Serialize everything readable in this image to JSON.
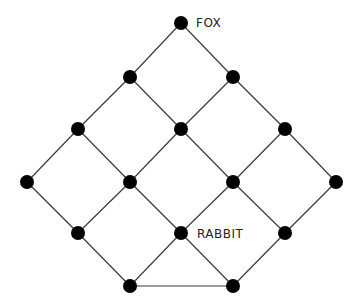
{
  "diagram": {
    "type": "lattice-graph",
    "colors": {
      "node": "#000000",
      "edge": "#3a3a3a",
      "label": "#222222",
      "background": "#ffffff"
    },
    "node_radius": 7,
    "nodes": [
      {
        "id": "n0",
        "x": 181,
        "y": 23,
        "label": "FOX"
      },
      {
        "id": "n1",
        "x": 130,
        "y": 77,
        "label": ""
      },
      {
        "id": "n2",
        "x": 233,
        "y": 77,
        "label": ""
      },
      {
        "id": "n3",
        "x": 78,
        "y": 129,
        "label": ""
      },
      {
        "id": "n4",
        "x": 181,
        "y": 129,
        "label": ""
      },
      {
        "id": "n5",
        "x": 285,
        "y": 129,
        "label": ""
      },
      {
        "id": "n6",
        "x": 27,
        "y": 182,
        "label": ""
      },
      {
        "id": "n7",
        "x": 130,
        "y": 182,
        "label": ""
      },
      {
        "id": "n8",
        "x": 233,
        "y": 182,
        "label": ""
      },
      {
        "id": "n9",
        "x": 336,
        "y": 182,
        "label": ""
      },
      {
        "id": "n10",
        "x": 78,
        "y": 233,
        "label": ""
      },
      {
        "id": "n11",
        "x": 181,
        "y": 233,
        "label": "RABBIT"
      },
      {
        "id": "n12",
        "x": 285,
        "y": 233,
        "label": ""
      },
      {
        "id": "n13",
        "x": 130,
        "y": 286,
        "label": ""
      },
      {
        "id": "n14",
        "x": 233,
        "y": 286,
        "label": ""
      }
    ],
    "edges": [
      [
        "n0",
        "n1"
      ],
      [
        "n0",
        "n2"
      ],
      [
        "n1",
        "n3"
      ],
      [
        "n1",
        "n4"
      ],
      [
        "n2",
        "n4"
      ],
      [
        "n2",
        "n5"
      ],
      [
        "n3",
        "n6"
      ],
      [
        "n3",
        "n7"
      ],
      [
        "n4",
        "n7"
      ],
      [
        "n4",
        "n8"
      ],
      [
        "n5",
        "n8"
      ],
      [
        "n5",
        "n9"
      ],
      [
        "n6",
        "n10"
      ],
      [
        "n7",
        "n10"
      ],
      [
        "n7",
        "n11"
      ],
      [
        "n8",
        "n11"
      ],
      [
        "n8",
        "n12"
      ],
      [
        "n9",
        "n12"
      ],
      [
        "n10",
        "n13"
      ],
      [
        "n11",
        "n13"
      ],
      [
        "n11",
        "n14"
      ],
      [
        "n12",
        "n14"
      ],
      [
        "n13",
        "n14"
      ]
    ],
    "labels": {
      "fox": "FOX",
      "rabbit": "RABBIT"
    }
  }
}
